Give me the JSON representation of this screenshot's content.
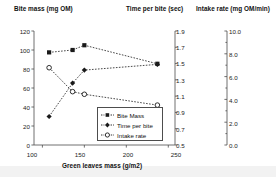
{
  "chart_data": {
    "type": "line",
    "title": "",
    "xlabel": "Green leaves mass (g/m2)",
    "x": [
      108,
      136,
      150,
      237
    ],
    "xlim": [
      90,
      258
    ],
    "xticks": [
      100,
      150,
      200,
      250
    ],
    "grid": false,
    "legend_position": "inside-bottom-center",
    "axes": [
      {
        "id": "left",
        "label": "Bite mass (mg OM)",
        "lim": [
          0,
          120
        ],
        "ticks": [
          0,
          20,
          40,
          60,
          80,
          100,
          120
        ],
        "tick_labels": [
          "0",
          "20",
          "40",
          "60",
          "80",
          "100",
          "120"
        ]
      },
      {
        "id": "middle",
        "label": "Time per bite (sec)",
        "lim": [
          0.5,
          1.9
        ],
        "ticks": [
          0.5,
          0.7,
          0.9,
          1.1,
          1.3,
          1.5,
          1.7,
          1.9
        ],
        "tick_labels": [
          "0.5",
          "0.7",
          "0.9",
          "1.1",
          "1.3",
          "1.5",
          "1.7",
          "1.9"
        ]
      },
      {
        "id": "right",
        "label": "Intake rate (mg OM/min)",
        "lim": [
          0.0,
          10.0
        ],
        "ticks": [
          0.0,
          2.0,
          4.0,
          6.0,
          8.0,
          10.0
        ],
        "tick_labels": [
          "0.0",
          "2.0",
          "4.0",
          "6.0",
          "8.0",
          "10.0"
        ]
      }
    ],
    "series": [
      {
        "name": "Bite Mass",
        "legend_label": "Bite Mass",
        "axis": "left",
        "marker": "filled-square",
        "line": "dashed",
        "color": "#1a1a1a",
        "values": [
          97.5,
          100.0,
          105.0,
          85.5
        ]
      },
      {
        "name": "Time per bite",
        "legend_label": "Time per bite",
        "axis": "middle",
        "marker": "filled-diamond",
        "line": "dashed",
        "color": "#1a1a1a",
        "values": [
          0.85,
          1.26,
          1.42,
          1.49
        ]
      },
      {
        "name": "Intake rate",
        "legend_label": "Intake rate",
        "axis": "right",
        "marker": "open-circle",
        "line": "dashed",
        "color": "#1a1a1a",
        "values": [
          6.78,
          4.68,
          4.45,
          3.5
        ]
      }
    ]
  },
  "figure": {
    "left_axis_title": "Bite mass (mg OM)",
    "middle_axis_title": "Time per bite (sec)",
    "right_axis_title": "Intake rate (mg OM/min)",
    "x_axis_title": "Green leaves mass (g/m2)",
    "legend": {
      "items": [
        {
          "label": "Bite Mass",
          "marker": "filled-square"
        },
        {
          "label": "Time per bite",
          "marker": "filled-diamond"
        },
        {
          "label": "Intake rate",
          "marker": "open-circle"
        }
      ]
    },
    "left_ticks": [
      "120",
      "100",
      "80",
      "60",
      "40",
      "20",
      "0"
    ],
    "mid_ticks": [
      "1.9",
      "1.7",
      "1.5",
      "1.3",
      "1.1",
      "0.9",
      "0.7",
      "0.5"
    ],
    "right_ticks": [
      "10.0",
      "8.0",
      "6.0",
      "4.0",
      "2.0",
      "0.0"
    ],
    "x_ticks": [
      "100",
      "150",
      "200",
      "250"
    ]
  }
}
